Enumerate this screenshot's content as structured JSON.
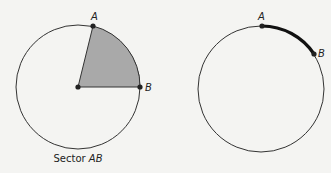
{
  "figures": [
    {
      "name": "sector",
      "caption_prefix": "Sector ",
      "caption_italic": "AB",
      "point_a_label": "A",
      "point_b_label": "B",
      "fill_color": "#a9a9a9"
    },
    {
      "name": "arc",
      "point_a_label": "A",
      "point_b_label": "B",
      "arc_color": "#111111"
    }
  ]
}
